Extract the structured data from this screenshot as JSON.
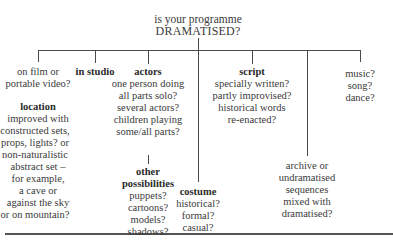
{
  "title": {
    "line1": "is your programme",
    "line2": "DRAMATISED?"
  },
  "branches": {
    "film": {
      "lines": [
        "on film or",
        "portable video?"
      ]
    },
    "location": {
      "heading": "location",
      "lines": [
        "improved with",
        "constructed sets,",
        "props, lights? or",
        "non-naturalistic",
        "abstract set –",
        "for example,",
        "a cave or",
        "against the sky",
        "or on mountain?"
      ]
    },
    "studio": {
      "heading": "in studio"
    },
    "actors": {
      "heading": "actors",
      "lines": [
        "one person doing",
        "all parts solo?",
        "several actors?",
        "children playing",
        "some/all parts?"
      ]
    },
    "other": {
      "heading1": "other",
      "heading2": "possibilities",
      "lines": [
        "puppets?",
        "cartoons?",
        "models?",
        "shadows?"
      ]
    },
    "costume": {
      "heading": "costume",
      "lines": [
        "historical?",
        "formal?",
        "casual?"
      ]
    },
    "script": {
      "heading": "script",
      "lines": [
        "specially written?",
        "partly improvised?",
        "historical words",
        "re-enacted?"
      ]
    },
    "archive": {
      "lines": [
        "archive or",
        "undramatised",
        "sequences",
        "mixed with",
        "dramatised?"
      ]
    },
    "music": {
      "lines": [
        "music?",
        "song?",
        "dance?"
      ]
    }
  }
}
